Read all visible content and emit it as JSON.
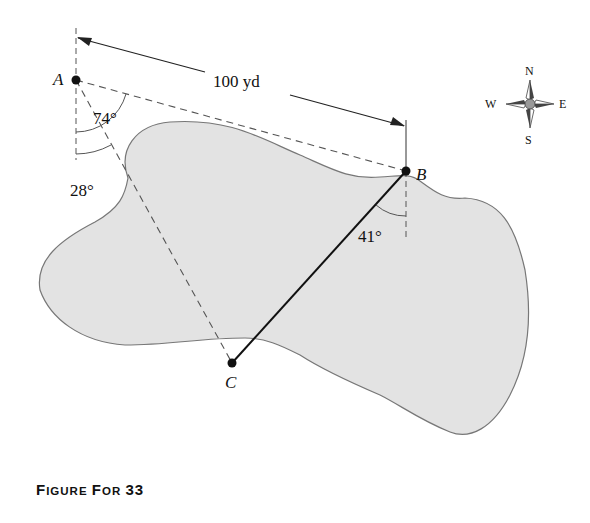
{
  "figure": {
    "caption": "Figure For 33",
    "caption_parts": [
      "F",
      "IGURE ",
      "F",
      "OR ",
      "33"
    ],
    "distance_label": "100 yd",
    "points": {
      "A": {
        "label": "A",
        "x": 76,
        "y": 80
      },
      "B": {
        "label": "B",
        "x": 406,
        "y": 171
      },
      "C": {
        "label": "C",
        "x": 232,
        "y": 363
      }
    },
    "angles": {
      "A_to_B": "74°",
      "A_to_C": "28°",
      "B_to_C": "41°"
    },
    "compass": {
      "N": "N",
      "S": "S",
      "E": "E",
      "W": "W"
    },
    "colors": {
      "land": "#e3e3e3",
      "outline": "#777777",
      "ink": "#111111",
      "dash": "#555555"
    }
  }
}
